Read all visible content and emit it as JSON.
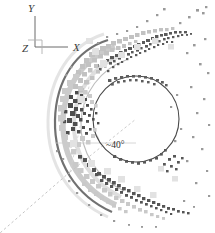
{
  "figure": {
    "name": "bow-shock-particle-scatter",
    "background_color": "#ffffff",
    "width": 215,
    "height": 233
  },
  "axes_triad": {
    "origin": {
      "x": 35,
      "y": 47
    },
    "x_label": "X",
    "y_label": "Y",
    "z_label": "Z",
    "x_end": {
      "x": 70,
      "y": 47
    },
    "y_end": {
      "x": 35,
      "y": 15
    },
    "color": "#6b6b6b",
    "label_color": "#3a3a3a"
  },
  "annotation": {
    "angle_label": "~40°",
    "angle_label_pos": {
      "x": 108,
      "y": 147
    },
    "color": "#2e2e2e"
  },
  "inner_circle": {
    "cx": 136,
    "cy": 119,
    "r": 43,
    "stroke": "#4a4a4a",
    "stroke_width": 1.1,
    "fill": "none"
  },
  "dashed_rays": [
    {
      "name": "ray-lower-left",
      "x1": 70,
      "y1": 172,
      "x2": 0,
      "y2": 233,
      "color": "#bdbdbd"
    },
    {
      "name": "ray-to-circle",
      "x1": 70,
      "y1": 172,
      "x2": 136,
      "y2": 119,
      "color": "#c4c4c4"
    },
    {
      "name": "ray-upper-right",
      "x1": 70,
      "y1": 172,
      "x2": 88,
      "y2": 80,
      "color": "#cfcfcf"
    },
    {
      "name": "ray-horizontal",
      "x1": 56,
      "y1": 143,
      "x2": 136,
      "y2": 143,
      "color": "#cccccc"
    }
  ],
  "arcs": [
    {
      "name": "outer-dark-arc",
      "stroke": "#585858",
      "stroke_width": 2.2,
      "opacity": 0.85,
      "d": "M 108 40 C 76 50 56 80 55 120 C 54 162 76 196 112 212"
    },
    {
      "name": "mid-light-arc",
      "stroke": "#b9b9b9",
      "stroke_width": 5.5,
      "opacity": 0.75,
      "d": "M 115 47 C 85 57 64 85 63 121 C 62 159 83 190 116 205"
    },
    {
      "name": "inner-faint-arc",
      "stroke": "#d6d6d6",
      "stroke_width": 4.0,
      "opacity": 0.8,
      "d": "M 122 55 C 95 64 75 90 74 122 C 73 155 92 183 121 197"
    },
    {
      "name": "outer-halo-arc",
      "stroke": "#d9d9d9",
      "stroke_width": 3.0,
      "opacity": 0.7,
      "d": "M 104 34 C 70 45 49 78 48 120 C 47 165 70 200 108 217"
    }
  ],
  "particle_bands": [
    {
      "name": "upper-dark-streak",
      "color": "#5a5a5a"
    },
    {
      "name": "upper-light-streak",
      "color": "#c2c2c2"
    },
    {
      "name": "lower-dark-streak",
      "color": "#555555"
    },
    {
      "name": "lower-light-streak",
      "color": "#c9c9c9"
    },
    {
      "name": "left-limb-cluster",
      "color": "#4e4e4e"
    },
    {
      "name": "sparse-field",
      "color": "#9a9a9a"
    }
  ],
  "colors": {
    "dark_gray": "#4a4a4a",
    "mid_gray": "#8a8a8a",
    "light_gray": "#c6c6c6",
    "pale_gray": "#e0e0e0"
  }
}
